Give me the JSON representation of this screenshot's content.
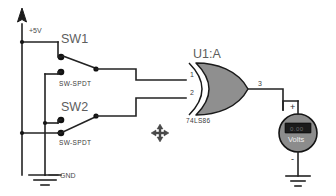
{
  "document": {
    "title": "XOR Gate Switch Circuit",
    "background_color": "#ffffff",
    "wire_color": "#232323"
  },
  "power": {
    "supply_label": "+5V",
    "supply_icon": "voltage-source-arrow-icon",
    "ground_label": "GND",
    "ground_icon": "ground-symbol-icon"
  },
  "switches": [
    {
      "reference": "SW1",
      "value": "SW-SPDT",
      "type": "spdt-toggle-switch"
    },
    {
      "reference": "SW2",
      "value": "SW-SPDT",
      "type": "spdt-toggle-switch"
    }
  ],
  "gate": {
    "reference": "U1:A",
    "value": "74LS86",
    "type": "xor-gate",
    "pins": {
      "input_a": "1",
      "input_b": "2",
      "output": "3"
    }
  },
  "meter": {
    "label": "Volts",
    "type": "voltmeter",
    "display_text": "0.00",
    "plus_terminal": "+",
    "minus_terminal": "-",
    "ground_icon": "ground-symbol-icon"
  },
  "cursor": {
    "icon": "move-crosshair-cursor-icon"
  }
}
